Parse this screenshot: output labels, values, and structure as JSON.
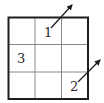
{
  "diagram": {
    "type": "grid",
    "rows": 3,
    "cols": 3,
    "colors": {
      "outer_border": "#1e1e1e",
      "inner_lines": "#8a8a8a",
      "arrows": "#1e1e1e",
      "text": "#2a2a2a"
    },
    "cells": [
      {
        "row": 0,
        "col": 1,
        "label": "1",
        "arrow": "up-right"
      },
      {
        "row": 1,
        "col": 0,
        "label": "3",
        "arrow": null
      },
      {
        "row": 2,
        "col": 2,
        "label": "2",
        "arrow": "up-right"
      }
    ]
  },
  "labels": {
    "one": "1",
    "two": "2",
    "three": "3"
  }
}
